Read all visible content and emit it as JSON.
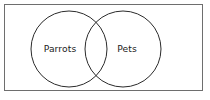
{
  "figure": {
    "type": "venn-diagram",
    "caption": "",
    "background_color": "#ffffff"
  },
  "frame": {
    "name": "universal-set-rectangle",
    "stroke_color": "#6e6e6e",
    "fill_color": "#ffffff",
    "x": 4,
    "y": 4,
    "width": 199,
    "height": 87
  },
  "sets": [
    {
      "id": "parrots",
      "label": "Parrots",
      "cx": 69,
      "cy": 49,
      "r": 38,
      "stroke_color": "#2b2b2b",
      "fill_color": "none",
      "label_x": 60,
      "label_y": 49
    },
    {
      "id": "pets",
      "label": "Pets",
      "cx": 123,
      "cy": 49,
      "r": 38,
      "stroke_color": "#2b2b2b",
      "fill_color": "none",
      "label_x": 127,
      "label_y": 49
    }
  ],
  "relationship": {
    "kind": "overlapping",
    "description": "Two overlapping circles inside a rectangle"
  }
}
